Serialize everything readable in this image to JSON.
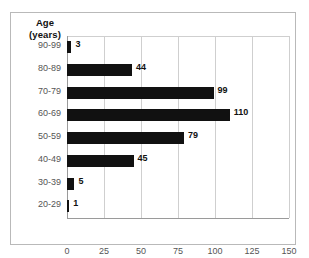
{
  "chart_data": {
    "type": "bar",
    "orientation": "horizontal",
    "title": "",
    "ylabel": "Age (years)",
    "xlabel": "",
    "categories": [
      "20-29",
      "30-39",
      "40-49",
      "50-59",
      "60-69",
      "70-79",
      "80-89",
      "90-99"
    ],
    "values": [
      1,
      5,
      45,
      79,
      110,
      99,
      44,
      3
    ],
    "xlim": [
      0,
      150
    ],
    "xticks": [
      0,
      25,
      50,
      75,
      100,
      125,
      150
    ],
    "xtick_labels": [
      "0",
      "25",
      "50",
      "75",
      "100",
      "125",
      "150"
    ],
    "data_labels": [
      "1",
      "5",
      "45",
      "79",
      "110",
      "99",
      "44",
      "3"
    ],
    "grid": true,
    "grid_axis": "x",
    "legend": false,
    "bar_color": "#111111",
    "grid_color": "#cfcfcf",
    "axis_color": "#9a9a9a"
  },
  "axis_title": {
    "line1": "Age",
    "line2": "(years)"
  },
  "rows": [
    {
      "category": "90-99",
      "value": 3,
      "label": "3"
    },
    {
      "category": "80-89",
      "value": 44,
      "label": "44"
    },
    {
      "category": "70-79",
      "value": 99,
      "label": "99"
    },
    {
      "category": "60-69",
      "value": 110,
      "label": "110"
    },
    {
      "category": "50-59",
      "value": 79,
      "label": "79"
    },
    {
      "category": "40-49",
      "value": 45,
      "label": "45"
    },
    {
      "category": "30-39",
      "value": 5,
      "label": "5"
    },
    {
      "category": "20-29",
      "value": 1,
      "label": "1"
    }
  ],
  "xticks": [
    {
      "label": "0",
      "value": 0
    },
    {
      "label": "25",
      "value": 25
    },
    {
      "label": "50",
      "value": 50
    },
    {
      "label": "75",
      "value": 75
    },
    {
      "label": "100",
      "value": 100
    },
    {
      "label": "125",
      "value": 125
    },
    {
      "label": "150",
      "value": 150
    }
  ]
}
